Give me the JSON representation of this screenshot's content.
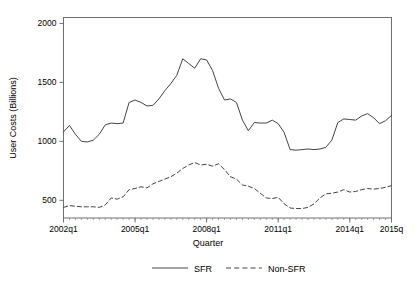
{
  "chart_data": {
    "type": "line",
    "title": "",
    "xlabel": "Quarter",
    "ylabel": "User Costs (Billions)",
    "xlim": [
      2002.0,
      2015.75
    ],
    "ylim": [
      350,
      2050
    ],
    "yticks": [
      500,
      1000,
      1500,
      2000
    ],
    "ytick_labels": [
      "500",
      "1000",
      "1500",
      "2000"
    ],
    "xticks": [
      2002.0,
      2005.0,
      2008.0,
      2011.0,
      2014.0,
      2015.75
    ],
    "xtick_labels": [
      "2002q1",
      "2005q1",
      "2008q1",
      "2011q1",
      "2014q1",
      "2015q"
    ],
    "grid": false,
    "legend_position": "bottom",
    "x": [
      2002.0,
      2002.25,
      2002.5,
      2002.75,
      2003.0,
      2003.25,
      2003.5,
      2003.75,
      2004.0,
      2004.25,
      2004.5,
      2004.75,
      2005.0,
      2005.25,
      2005.5,
      2005.75,
      2006.0,
      2006.25,
      2006.5,
      2006.75,
      2007.0,
      2007.25,
      2007.5,
      2007.75,
      2008.0,
      2008.25,
      2008.5,
      2008.75,
      2009.0,
      2009.25,
      2009.5,
      2009.75,
      2010.0,
      2010.25,
      2010.5,
      2010.75,
      2011.0,
      2011.25,
      2011.5,
      2011.75,
      2012.0,
      2012.25,
      2012.5,
      2012.75,
      2013.0,
      2013.25,
      2013.5,
      2013.75,
      2014.0,
      2014.25,
      2014.5,
      2014.75,
      2015.0,
      2015.25,
      2015.5,
      2015.75
    ],
    "series": [
      {
        "name": "SFR",
        "style": "solid",
        "color": "#444444",
        "values": [
          1080,
          1135,
          1060,
          1000,
          995,
          1010,
          1060,
          1140,
          1155,
          1150,
          1155,
          1330,
          1350,
          1330,
          1300,
          1305,
          1360,
          1430,
          1490,
          1560,
          1700,
          1660,
          1620,
          1700,
          1690,
          1600,
          1450,
          1350,
          1360,
          1330,
          1180,
          1090,
          1160,
          1155,
          1155,
          1180,
          1150,
          1075,
          930,
          925,
          930,
          935,
          930,
          935,
          950,
          1010,
          1160,
          1190,
          1185,
          1180,
          1215,
          1235,
          1200,
          1150,
          1175,
          1220
        ]
      },
      {
        "name": "Non-SFR",
        "style": "dashed",
        "color": "#444444",
        "values": [
          440,
          455,
          450,
          445,
          445,
          445,
          440,
          460,
          520,
          510,
          530,
          590,
          600,
          615,
          605,
          640,
          660,
          680,
          700,
          730,
          770,
          800,
          820,
          800,
          805,
          790,
          810,
          760,
          700,
          680,
          630,
          620,
          600,
          560,
          520,
          515,
          525,
          470,
          435,
          430,
          430,
          440,
          470,
          520,
          555,
          560,
          570,
          590,
          570,
          575,
          590,
          600,
          595,
          600,
          610,
          625
        ]
      }
    ]
  },
  "legend": {
    "items": [
      {
        "label": "SFR",
        "style": "solid"
      },
      {
        "label": "Non-SFR",
        "style": "dashed"
      }
    ]
  }
}
